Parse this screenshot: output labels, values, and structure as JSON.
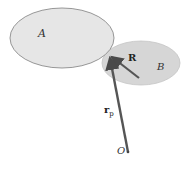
{
  "diagram": {
    "regions": [
      {
        "id": "A",
        "label": "A",
        "fill": "#e4e4e4",
        "stroke": "#8a8a8a"
      },
      {
        "id": "B",
        "label": "B",
        "fill": "#d4d4d4",
        "stroke": "#bdbdbd"
      }
    ],
    "vectors": [
      {
        "id": "R",
        "label": "R",
        "color": "#555555"
      },
      {
        "id": "r_p",
        "label": "r",
        "subscript": "p",
        "color": "#555555"
      }
    ],
    "origin": {
      "label": "O"
    }
  }
}
